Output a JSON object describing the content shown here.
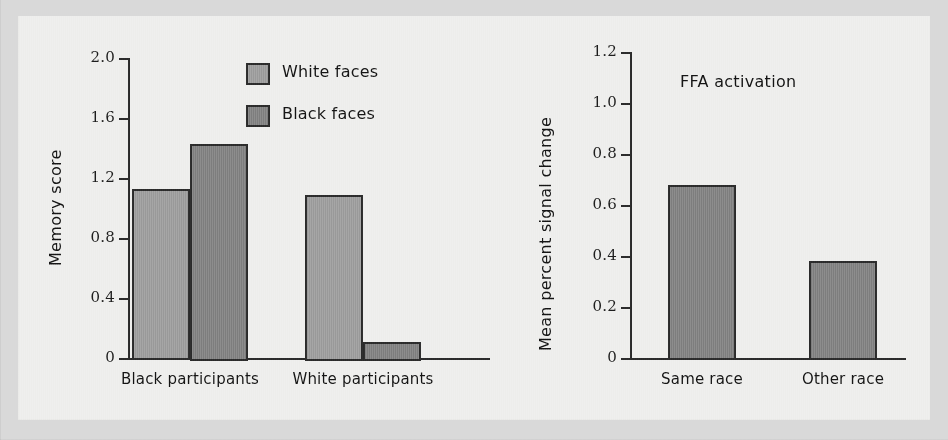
{
  "figure": {
    "background_color": "#eeeeec",
    "outer_margin_color": "#d9d9d9"
  },
  "colors": {
    "white_faces": "#9b9b9b",
    "black_faces": "#7f7f7f",
    "axis": "#2b2b2b",
    "text": "#141414"
  },
  "chart_data": [
    {
      "type": "bar",
      "title": "",
      "xlabel": "",
      "ylabel": "Memory score",
      "ylim": [
        0,
        2.0
      ],
      "yticks": [
        "0",
        "0.4",
        "0.8",
        "1.2",
        "1.6",
        "2.0"
      ],
      "ytick_values": [
        0,
        0.4,
        0.8,
        1.2,
        1.6,
        2.0
      ],
      "grid": false,
      "legend_position": "top-right",
      "categories": [
        "Black participants",
        "White participants"
      ],
      "series": [
        {
          "name": "White faces",
          "color": "#9b9b9b",
          "values": [
            1.13,
            1.09
          ]
        },
        {
          "name": "Black faces",
          "color": "#7f7f7f",
          "values": [
            1.43,
            0.11
          ]
        }
      ]
    },
    {
      "type": "bar",
      "title": "FFA activation",
      "xlabel": "",
      "ylabel": "Mean percent signal change",
      "ylim": [
        0,
        1.2
      ],
      "yticks": [
        "0",
        "0.2",
        "0.4",
        "0.6",
        "0.8",
        "1.0",
        "1.2"
      ],
      "ytick_values": [
        0,
        0.2,
        0.4,
        0.6,
        0.8,
        1.0,
        1.2
      ],
      "grid": false,
      "legend_position": "none",
      "categories": [
        "Same race",
        "Other race"
      ],
      "series": [
        {
          "name": "FFA activation",
          "color": "#7f7f7f",
          "values": [
            0.68,
            0.38
          ]
        }
      ]
    }
  ]
}
